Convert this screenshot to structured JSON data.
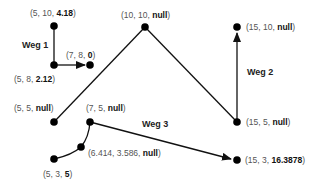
{
  "diagram": {
    "ways": [
      {
        "label": "Weg 1"
      },
      {
        "label": "Weg 2"
      },
      {
        "label": "Weg 3"
      }
    ],
    "nodes": [
      {
        "pre": "(5, 10, ",
        "val": "4.18",
        "post": ")"
      },
      {
        "pre": "(5, 8, ",
        "val": "2.12",
        "post": ")"
      },
      {
        "pre": "(7, 8, ",
        "val": "0",
        "post": ")"
      },
      {
        "pre": "(10, 10, ",
        "val": "null",
        "post": ")"
      },
      {
        "pre": "(15, 10, ",
        "val": "null",
        "post": ")"
      },
      {
        "pre": "(5, 5, ",
        "val": "null",
        "post": ")"
      },
      {
        "pre": "(7, 5, ",
        "val": "null",
        "post": ")"
      },
      {
        "pre": "(6.414, 3.586, ",
        "val": "null",
        "post": ")"
      },
      {
        "pre": "(5, 3, ",
        "val": "5",
        "post": ")"
      },
      {
        "pre": "(15, 5, ",
        "val": "null",
        "post": ")"
      },
      {
        "pre": "(15, 3, ",
        "val": "16.3878",
        "post": ")"
      }
    ],
    "colors": {
      "line": "#111111",
      "node": "#000000",
      "label": "#555555"
    }
  }
}
